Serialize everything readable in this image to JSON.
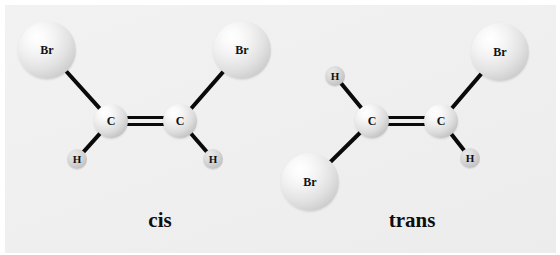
{
  "figure": {
    "background_color": "#f0f0f0",
    "page_color": "#ffffff",
    "bond_color": "#0a0a0a",
    "label_color": "#111111"
  },
  "molecules": [
    {
      "id": "cis",
      "caption": "cis",
      "caption_x": 160,
      "caption_y": 208,
      "atoms": [
        {
          "element": "Br",
          "label": "Br",
          "x": 47,
          "y": 50,
          "r": 29
        },
        {
          "element": "Br",
          "label": "Br",
          "x": 242,
          "y": 50,
          "r": 29
        },
        {
          "element": "C",
          "label": "C",
          "x": 111,
          "y": 121,
          "r": 17
        },
        {
          "element": "C",
          "label": "C",
          "x": 180,
          "y": 121,
          "r": 17
        },
        {
          "element": "H",
          "label": "H",
          "x": 77,
          "y": 159,
          "r": 10
        },
        {
          "element": "H",
          "label": "H",
          "x": 213,
          "y": 159,
          "r": 10
        }
      ],
      "bonds": [
        {
          "from": 0,
          "to": 2,
          "order": 1
        },
        {
          "from": 1,
          "to": 3,
          "order": 1
        },
        {
          "from": 2,
          "to": 4,
          "order": 1
        },
        {
          "from": 3,
          "to": 5,
          "order": 1
        },
        {
          "from": 2,
          "to": 3,
          "order": 2
        }
      ]
    },
    {
      "id": "trans",
      "caption": "trans",
      "caption_x": 412,
      "caption_y": 208,
      "atoms": [
        {
          "element": "H",
          "label": "H",
          "x": 335,
          "y": 76,
          "r": 10
        },
        {
          "element": "Br",
          "label": "Br",
          "x": 310,
          "y": 182,
          "r": 29
        },
        {
          "element": "C",
          "label": "C",
          "x": 372,
          "y": 121,
          "r": 17
        },
        {
          "element": "C",
          "label": "C",
          "x": 441,
          "y": 121,
          "r": 17
        },
        {
          "element": "Br",
          "label": "Br",
          "x": 500,
          "y": 52,
          "r": 29
        },
        {
          "element": "H",
          "label": "H",
          "x": 470,
          "y": 158,
          "r": 10
        }
      ],
      "bonds": [
        {
          "from": 0,
          "to": 2,
          "order": 1
        },
        {
          "from": 1,
          "to": 2,
          "order": 1
        },
        {
          "from": 3,
          "to": 4,
          "order": 1
        },
        {
          "from": 3,
          "to": 5,
          "order": 1
        },
        {
          "from": 2,
          "to": 3,
          "order": 2
        }
      ]
    }
  ]
}
